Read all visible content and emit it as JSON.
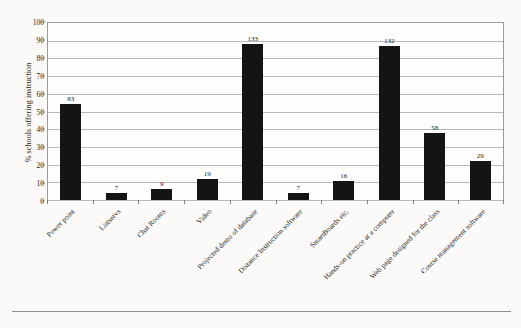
{
  "chart_data": {
    "type": "bar",
    "title": "",
    "xlabel": "",
    "ylabel": "% schools offering instruction",
    "ylim": [
      0,
      100
    ],
    "ytick_labels": [
      "100",
      "90",
      "80",
      "70",
      "60",
      "50",
      "40",
      "30",
      "20",
      "10",
      "0"
    ],
    "ytick_values": [
      100,
      90,
      80,
      70,
      60,
      50,
      40,
      30,
      20,
      10,
      0
    ],
    "grid": true,
    "legend": "none",
    "point_label_note": "Labels above bars are counts of schools (n), not percentages.",
    "categories": [
      "Power point",
      "Listservs",
      "Chat Rooms",
      "Video",
      "Projected demo of database",
      "Distance Instruction software",
      "SmartBoards etc.",
      "Hands-on practice at a computer",
      "Web page designed for the class",
      "Course management software"
    ],
    "values": [
      54,
      4,
      6,
      12,
      88,
      4,
      11,
      87,
      38,
      22
    ],
    "bar_labels": [
      "83",
      "7",
      "9",
      "19",
      "133",
      "7",
      "16",
      "132",
      "58",
      "29"
    ],
    "bar_color": "#141414"
  }
}
